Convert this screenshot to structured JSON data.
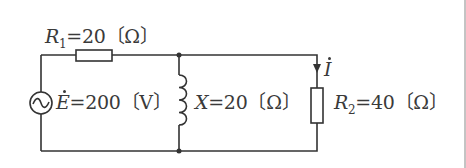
{
  "diagram": {
    "type": "circuit",
    "colors": {
      "wire": "#333333",
      "text": "#3a3a3a",
      "background": "#ffffff"
    },
    "source": {
      "symbol": "ac-voltage-source",
      "name": "E",
      "equals": "=200",
      "unit": "〔V〕"
    },
    "r1": {
      "name": "R",
      "sub": "1",
      "equals": "=20",
      "unit": "〔Ω〕"
    },
    "inductor": {
      "name": "X",
      "equals": "=20",
      "unit": "〔Ω〕"
    },
    "r2": {
      "name": "R",
      "sub": "2",
      "equals": "=40",
      "unit": "〔Ω〕"
    },
    "current": {
      "name": "I",
      "direction": "down"
    }
  }
}
